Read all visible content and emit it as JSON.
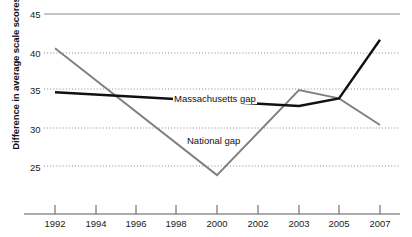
{
  "chart_data": {
    "type": "line",
    "title": "",
    "xlabel": "",
    "ylabel": "Difference in average scale scores",
    "x": [
      1992,
      1994,
      1996,
      1998,
      2000,
      2002,
      2003,
      2005,
      2007
    ],
    "xtick_labels": [
      "1992",
      "1994",
      "1996",
      "1998",
      "2000",
      "2002",
      "2003",
      "2005",
      "2007"
    ],
    "ytick_labels": [
      "25",
      "30",
      "35",
      "40",
      "45"
    ],
    "yticks": [
      25,
      30,
      35,
      40,
      45
    ],
    "ylim": [
      22.5,
      45
    ],
    "grid": "horizontal-dotted",
    "legend": "inline-labels",
    "series": [
      {
        "name": "Massachusetts gap",
        "color": "#111111",
        "label_text": "Massachusetts gap",
        "values": [
          34.7,
          null,
          null,
          null,
          null,
          null,
          32.9,
          33.9,
          41.6
        ],
        "vertices_x": [
          1992,
          2003,
          2005,
          2007
        ],
        "vertices_y": [
          34.7,
          32.9,
          33.9,
          41.6
        ]
      },
      {
        "name": "National gap",
        "color": "#808080",
        "label_text": "National gap",
        "values": [
          40.5,
          null,
          null,
          null,
          23.8,
          null,
          35.0,
          33.9,
          30.4
        ],
        "vertices_x": [
          1992,
          2000,
          2003,
          2005,
          2007
        ],
        "vertices_y": [
          40.5,
          23.8,
          35.0,
          33.9,
          30.4
        ]
      }
    ]
  },
  "axes": {
    "y_title": "Difference in average scale scores",
    "y_ticks": [
      "45",
      "40",
      "35",
      "30",
      "25"
    ],
    "x_ticks": [
      "1992",
      "1994",
      "1996",
      "1998",
      "2000",
      "2002",
      "2003",
      "2005",
      "2007"
    ]
  },
  "annotations": {
    "massachusetts_label": "Massachusetts gap",
    "national_label": "National gap"
  },
  "colors": {
    "massachusetts_line": "#111111",
    "national_line": "#808080",
    "grid": "#9a9a9a",
    "axis": "#555555",
    "text": "#1a1a1a"
  }
}
